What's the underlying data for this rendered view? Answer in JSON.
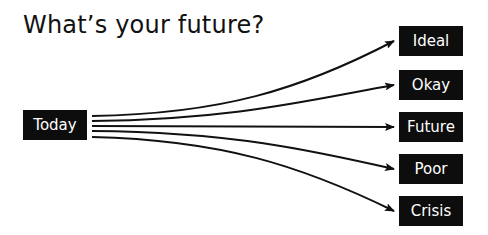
{
  "title": "What’s your future?",
  "source": {
    "label": "Today"
  },
  "outcomes": [
    {
      "label": "Ideal"
    },
    {
      "label": "Okay"
    },
    {
      "label": "Future"
    },
    {
      "label": "Poor"
    },
    {
      "label": "Crisis"
    }
  ],
  "colors": {
    "box_bg": "#0d0d0d",
    "box_text": "#ffffff",
    "line": "#111111"
  }
}
